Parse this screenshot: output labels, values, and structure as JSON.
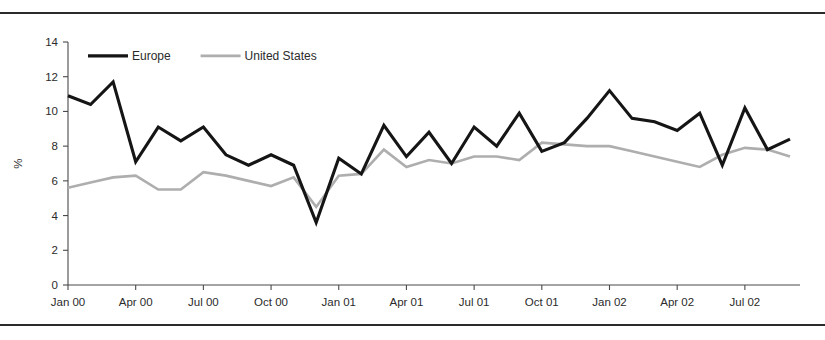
{
  "figure": {
    "background_color": "#ffffff",
    "rule_color": "#2a2a2a",
    "top_rule_name": "top-divider-rule",
    "bottom_rule_name": "bottom-divider-rule"
  },
  "chart_data": {
    "type": "line",
    "title": "",
    "subtitle": "",
    "xlabel": "",
    "ylabel": "%",
    "ylim": [
      0,
      14
    ],
    "ytick_step": 2,
    "ytick_labels": [
      "0",
      "2",
      "4",
      "6",
      "8",
      "10",
      "12",
      "14"
    ],
    "ytick_values": [
      0,
      2,
      4,
      6,
      8,
      10,
      12,
      14
    ],
    "grid": false,
    "legend_position": "top-left-inside",
    "x": [
      "Jan 00",
      "Feb 00",
      "Mar 00",
      "Apr 00",
      "May 00",
      "Jun 00",
      "Jul 00",
      "Aug 00",
      "Sep 00",
      "Oct 00",
      "Nov 00",
      "Dec 00",
      "Jan 01",
      "Feb 01",
      "Mar 01",
      "Apr 01",
      "May 01",
      "Jun 01",
      "Jul 01",
      "Aug 01",
      "Sep 01",
      "Oct 01",
      "Nov 01",
      "Dec 01",
      "Jan 02",
      "Feb 02",
      "Mar 02",
      "Apr 02",
      "May 02",
      "Jun 02",
      "Jul 02",
      "Aug 02",
      "Sep 02"
    ],
    "xtick_labels": [
      "Jan 00",
      "Apr 00",
      "Jul 00",
      "Oct 00",
      "Jan 01",
      "Apr 01",
      "Jul 01",
      "Oct 01",
      "Jan 02",
      "Apr 02",
      "Jul 02"
    ],
    "xtick_indices": [
      0,
      3,
      6,
      9,
      12,
      15,
      18,
      21,
      24,
      27,
      30
    ],
    "series": [
      {
        "name": "Europe",
        "color": "#151515",
        "width": 3.1,
        "values": [
          10.9,
          10.4,
          11.7,
          7.1,
          9.1,
          8.3,
          9.1,
          7.5,
          6.9,
          7.5,
          6.9,
          3.6,
          7.3,
          6.4,
          9.2,
          7.4,
          8.8,
          7.0,
          9.1,
          8.0,
          9.9,
          7.7,
          8.2,
          9.6,
          11.2,
          9.6,
          9.4,
          8.9,
          9.9,
          6.9,
          10.2,
          7.8,
          8.4
        ]
      },
      {
        "name": "United States",
        "color": "#aeaeae",
        "width": 2.6,
        "values": [
          5.6,
          5.9,
          6.2,
          6.3,
          5.5,
          5.5,
          6.5,
          6.3,
          6.0,
          5.7,
          6.2,
          4.5,
          6.3,
          6.4,
          7.8,
          6.8,
          7.2,
          7.0,
          7.4,
          7.4,
          7.2,
          8.2,
          8.1,
          8.0,
          8.0,
          7.7,
          7.4,
          7.1,
          6.8,
          7.5,
          7.9,
          7.8,
          7.4
        ]
      }
    ],
    "legend": [
      {
        "label": "Europe",
        "color": "#151515"
      },
      {
        "label": "United States",
        "color": "#aeaeae"
      }
    ]
  }
}
